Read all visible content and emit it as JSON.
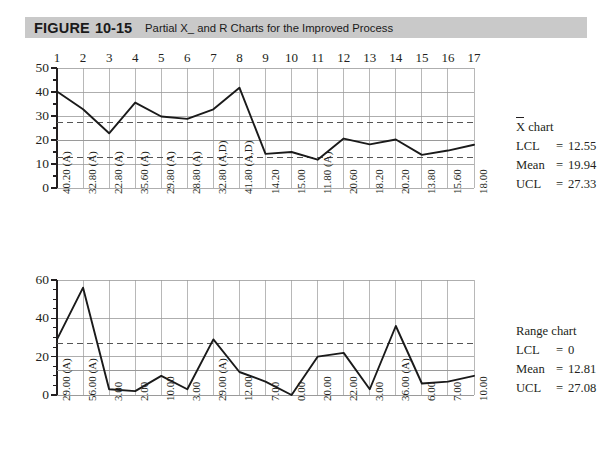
{
  "figure": {
    "label_word": "FIGURE",
    "label_number": "10-15",
    "caption": "Partial X_ and R Charts for the Improved Process"
  },
  "xbar_chart": {
    "legend": {
      "title_prefix": "X",
      "title_suffix": " chart",
      "rows": [
        {
          "key": "LCL",
          "eq": "=",
          "value": "12.55"
        },
        {
          "key": "Mean",
          "eq": "=",
          "value": "19.94"
        },
        {
          "key": "UCL",
          "eq": "=",
          "value": "27.33"
        }
      ]
    }
  },
  "range_chart": {
    "legend": {
      "title": "Range chart",
      "rows": [
        {
          "key": "LCL",
          "eq": "=",
          "value": "0"
        },
        {
          "key": "Mean",
          "eq": "=",
          "value": "12.81"
        },
        {
          "key": "UCL",
          "eq": "=",
          "value": "27.08"
        }
      ]
    }
  },
  "chart_data": [
    {
      "id": "xbar",
      "type": "line",
      "title": "X-bar chart",
      "xlabel": "",
      "ylabel": "",
      "ylim": [
        0,
        50
      ],
      "yticks": [
        0,
        10,
        20,
        30,
        40,
        50
      ],
      "ytick_labels": [
        "0",
        "10",
        "20",
        "30",
        "40",
        "50"
      ],
      "yminor_step": 5,
      "grid": true,
      "x": [
        1,
        2,
        3,
        4,
        5,
        6,
        7,
        8,
        9,
        10,
        11,
        12,
        13,
        14,
        15,
        16,
        17
      ],
      "xtick_labels": [
        "1",
        "2",
        "3",
        "4",
        "5",
        "6",
        "7",
        "8",
        "9",
        "10",
        "11",
        "12",
        "13",
        "14",
        "15",
        "16",
        "17"
      ],
      "values": [
        40.2,
        32.8,
        22.8,
        35.6,
        29.8,
        28.8,
        32.8,
        41.8,
        14.2,
        15.0,
        11.8,
        20.6,
        18.2,
        20.2,
        13.8,
        15.6,
        18.0
      ],
      "point_labels": [
        "40.20 (A)",
        "32.80 (A)",
        "22.80 (A)",
        "35.60 (A)",
        "29.80 (A)",
        "28.80 (A)",
        "32.80 (A,D)",
        "41.80 (A,D)",
        "14.20",
        "15.00",
        "11.80 (A)",
        "20.60",
        "18.20",
        "20.20",
        "13.80",
        "15.60",
        "18.00"
      ],
      "annotations": [
        {
          "name": "UCL",
          "value": 27.33,
          "style": "dashed"
        },
        {
          "name": "Mean",
          "value": 19.94,
          "style": "solid"
        },
        {
          "name": "LCL",
          "value": 12.55,
          "style": "dashed"
        }
      ],
      "legend_position": "right"
    },
    {
      "id": "range",
      "type": "line",
      "title": "Range chart",
      "xlabel": "",
      "ylabel": "",
      "ylim": [
        0,
        60
      ],
      "yticks": [
        0,
        20,
        40,
        60
      ],
      "ytick_labels": [
        "0",
        "20",
        "40",
        "60"
      ],
      "yminor_step": 5,
      "grid": true,
      "x": [
        1,
        2,
        3,
        4,
        5,
        6,
        7,
        8,
        9,
        10,
        11,
        12,
        13,
        14,
        15,
        16,
        17
      ],
      "xtick_labels": [
        "1",
        "2",
        "3",
        "4",
        "5",
        "6",
        "7",
        "8",
        "9",
        "10",
        "11",
        "12",
        "13",
        "14",
        "15",
        "16",
        "17"
      ],
      "values": [
        29.0,
        56.0,
        3.0,
        2.0,
        10.0,
        3.0,
        29.0,
        12.0,
        7.0,
        0.0,
        20.0,
        22.0,
        3.0,
        36.0,
        6.0,
        7.0,
        10.0
      ],
      "point_labels": [
        "29.00 (A)",
        "56.00 (A)",
        "3.00",
        "2.00",
        "10.00",
        "3.00",
        "29.00 (A)",
        "12.00",
        "7.00",
        "0.00",
        "20.00",
        "22.00",
        "3.00",
        "36.00 (A)",
        "6.00",
        "7.00",
        "10.00"
      ],
      "annotations": [
        {
          "name": "UCL",
          "value": 27.08,
          "style": "dashed"
        },
        {
          "name": "Mean",
          "value": 12.81,
          "style": "solid"
        },
        {
          "name": "LCL",
          "value": 0,
          "style": "solid"
        }
      ],
      "legend_position": "right"
    }
  ],
  "colors": {
    "band": "#c9c9c9",
    "ink": "#231f20",
    "grid": "#9a9a9a",
    "series": "#1a1a1a"
  }
}
